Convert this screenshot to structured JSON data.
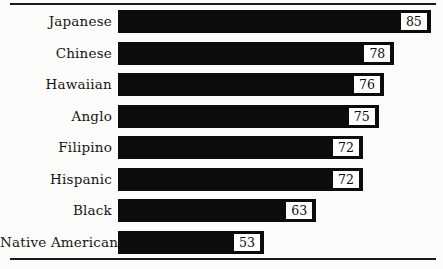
{
  "chart_data": {
    "type": "bar",
    "orientation": "horizontal",
    "title": "",
    "xlabel": "",
    "ylabel": "",
    "categories": [
      "Japanese",
      "Chinese",
      "Hawaiian",
      "Anglo",
      "Filipino",
      "Hispanic",
      "Black",
      "Native American"
    ],
    "values": [
      85,
      78,
      76,
      75,
      72,
      72,
      63,
      53
    ],
    "xlim": [
      25,
      86
    ],
    "grid": false,
    "legend": false,
    "value_labels": "shown in white boxes at bar ends",
    "colors": {
      "bar": "#0c0c0c",
      "background": "#fcfcfa",
      "rule": "#1a1a1a",
      "value_box_bg": "#ffffff",
      "text": "#111111"
    }
  }
}
